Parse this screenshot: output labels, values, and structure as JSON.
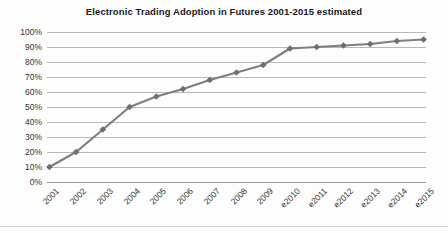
{
  "chart_data": {
    "type": "line",
    "title": "Electronic Trading Adoption in Futures 2001-2015 estimated",
    "xlabel": "",
    "ylabel": "",
    "categories": [
      "2001",
      "2002",
      "2003",
      "2004",
      "2005",
      "2006",
      "2007",
      "2008",
      "2009",
      "e2010",
      "e2011",
      "e2012",
      "e2013",
      "e2014",
      "e2015"
    ],
    "values": [
      10,
      20,
      35,
      50,
      57,
      62,
      68,
      73,
      78,
      89,
      90,
      91,
      92,
      94,
      95
    ],
    "series": [
      {
        "name": "Electronic Trading Adoption",
        "values": [
          10,
          20,
          35,
          50,
          57,
          62,
          68,
          73,
          78,
          89,
          90,
          91,
          92,
          94,
          95
        ]
      }
    ],
    "ytick_labels": [
      "100%",
      "90%",
      "80%",
      "70%",
      "60%",
      "50%",
      "40%",
      "30%",
      "20%",
      "10%",
      "0%"
    ],
    "ytick_values": [
      100,
      90,
      80,
      70,
      60,
      50,
      40,
      30,
      20,
      10,
      0
    ],
    "ylim": [
      0,
      100
    ],
    "value_unit": "%",
    "grid": "horizontal",
    "legend": "none",
    "line_color": "#7f7f7f",
    "marker_color": "#6e6e6e",
    "marker_shape": "diamond",
    "gridline_color": "#b8b8b8",
    "text_color": "#333333",
    "background_color": "#fdfdfd"
  }
}
